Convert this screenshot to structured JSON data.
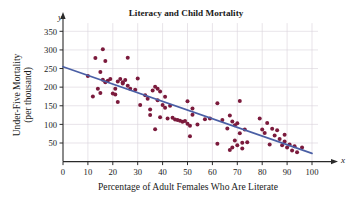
{
  "chart_data": {
    "type": "scatter",
    "title": "Literacy and Child Mortality",
    "xlabel": "Percentage of Adult Females Who Are Literate",
    "ylabel": "Under-Five Mortality (per thousand)",
    "x_axis_name": "x",
    "y_axis_name": "y",
    "xlim": [
      0,
      100
    ],
    "ylim": [
      0,
      370
    ],
    "xticks": [
      0,
      10,
      20,
      30,
      40,
      50,
      60,
      70,
      80,
      90,
      100
    ],
    "xtick_labels": [
      "0",
      "10",
      "20",
      "30",
      "40",
      "50",
      "60",
      "70",
      "80",
      "90",
      "100"
    ],
    "yticks": [
      50,
      100,
      150,
      200,
      250,
      300,
      350
    ],
    "ytick_labels": [
      "50",
      "100",
      "150",
      "200",
      "250",
      "300",
      "350"
    ],
    "grid": true,
    "legend": "none",
    "point_color": "#7B1A3C",
    "line_color": "#4A5FA5",
    "grid_color": "#D9D2DA",
    "axis_color": "#2A2A2A",
    "background_color": "#FFFFFF",
    "points": [
      [
        10,
        230
      ],
      [
        12,
        175
      ],
      [
        13,
        278
      ],
      [
        14,
        196
      ],
      [
        15,
        241
      ],
      [
        15,
        184
      ],
      [
        16,
        302
      ],
      [
        16,
        220
      ],
      [
        17,
        270
      ],
      [
        17,
        213
      ],
      [
        18,
        217
      ],
      [
        19,
        222
      ],
      [
        20,
        183
      ],
      [
        21,
        196
      ],
      [
        21,
        180
      ],
      [
        22,
        160
      ],
      [
        22,
        215
      ],
      [
        23,
        222
      ],
      [
        24,
        213
      ],
      [
        24,
        210
      ],
      [
        25,
        219
      ],
      [
        26,
        279
      ],
      [
        26,
        204
      ],
      [
        27,
        196
      ],
      [
        29,
        193
      ],
      [
        30,
        223
      ],
      [
        31,
        152
      ],
      [
        33,
        178
      ],
      [
        34,
        169
      ],
      [
        35,
        125
      ],
      [
        35,
        140
      ],
      [
        36,
        191
      ],
      [
        37,
        87
      ],
      [
        37,
        201
      ],
      [
        38,
        196
      ],
      [
        38,
        165
      ],
      [
        39,
        119
      ],
      [
        39,
        188
      ],
      [
        40,
        152
      ],
      [
        41,
        145
      ],
      [
        41,
        174
      ],
      [
        42,
        116
      ],
      [
        43,
        150
      ],
      [
        44,
        118
      ],
      [
        45,
        113
      ],
      [
        46,
        112
      ],
      [
        47,
        110
      ],
      [
        48,
        107
      ],
      [
        49,
        109
      ],
      [
        50,
        102
      ],
      [
        50,
        162
      ],
      [
        51,
        96
      ],
      [
        51,
        68
      ],
      [
        52,
        143
      ],
      [
        52,
        126
      ],
      [
        54,
        100
      ],
      [
        57,
        114
      ],
      [
        59,
        116
      ],
      [
        62,
        157
      ],
      [
        62,
        48
      ],
      [
        64,
        112
      ],
      [
        66,
        89
      ],
      [
        67,
        31
      ],
      [
        67,
        124
      ],
      [
        68,
        38
      ],
      [
        68,
        108
      ],
      [
        69,
        98
      ],
      [
        69,
        57
      ],
      [
        70,
        103
      ],
      [
        70,
        44
      ],
      [
        71,
        163
      ],
      [
        71,
        76
      ],
      [
        72,
        35
      ],
      [
        72,
        51
      ],
      [
        73,
        86
      ],
      [
        74,
        52
      ],
      [
        79,
        116
      ],
      [
        80,
        86
      ],
      [
        81,
        77
      ],
      [
        82,
        104
      ],
      [
        83,
        46
      ],
      [
        84,
        88
      ],
      [
        85,
        70
      ],
      [
        86,
        84
      ],
      [
        87,
        61
      ],
      [
        88,
        44
      ],
      [
        89,
        72
      ],
      [
        89,
        54
      ],
      [
        90,
        38
      ],
      [
        91,
        46
      ],
      [
        92,
        30
      ],
      [
        93,
        41
      ],
      [
        94,
        25
      ],
      [
        96,
        38
      ]
    ],
    "trend_line": {
      "x0": 0,
      "y0": 255,
      "x1": 100,
      "y1": 22,
      "label": "least-squares regression line"
    }
  }
}
